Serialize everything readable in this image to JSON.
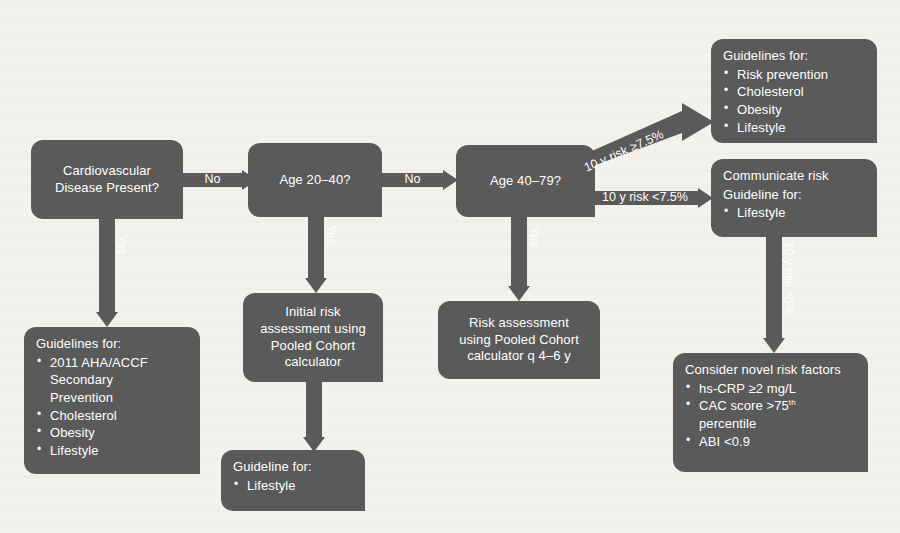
{
  "diagram": {
    "colors": {
      "box_fill": "#5a5a5a",
      "box_text": "#ffffff",
      "arrow_fill": "#5a5a5a",
      "background": "#f3f1ec"
    },
    "nodes": {
      "cvd_present": {
        "line1": "Cardiovascular",
        "line2": "Disease Present?"
      },
      "age_20_40": {
        "label": "Age 20–40?"
      },
      "age_40_79": {
        "label": "Age 40–79?"
      },
      "secondary_prevention": {
        "title": "Guidelines for:",
        "items": [
          "2011 AHA/ACCF",
          "Secondary",
          "Prevention",
          "Cholesterol",
          "Obesity",
          "Lifestyle"
        ]
      },
      "initial_risk": {
        "line1": "Initial risk",
        "line2": "assessment using",
        "line3": "Pooled Cohort",
        "line4": "calculator"
      },
      "lifestyle_guideline": {
        "title": "Guideline for:",
        "items": [
          "Lifestyle"
        ]
      },
      "risk_assessment_q46": {
        "line1": "Risk assessment",
        "line2": "using Pooled Cohort",
        "line3": "calculator q 4–6 y"
      },
      "guidelines_prevention": {
        "title": "Guidelines for:",
        "items": [
          "Risk prevention",
          "Cholesterol",
          "Obesity",
          "Lifestyle"
        ]
      },
      "communicate_risk": {
        "line1": "Communicate risk",
        "line2": "Guideline for:",
        "items": [
          "Lifestyle"
        ]
      },
      "novel_risk_factors": {
        "title": "Consider novel risk factors",
        "items": [
          "hs-CRP ≥2 mg/L",
          "CAC score >75",
          "percentile",
          "ABI <0.9"
        ],
        "superscript": "th"
      }
    },
    "edges": {
      "cvd_no": "No",
      "cvd_yes": "Yes",
      "age2040_no": "No",
      "age2040_yes": "Yes",
      "age4079_yes": "Yes",
      "risk_high": "10 y risk ≥7.5%",
      "risk_low": "10 y risk <7.5%",
      "risk_gt5": "10 y risk >5%"
    }
  }
}
